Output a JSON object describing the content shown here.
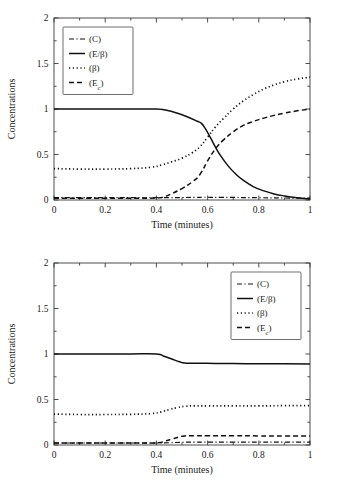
{
  "figure": {
    "background": "#ffffff",
    "ink_color": "#111111",
    "panels": [
      "top",
      "bottom"
    ]
  },
  "chart_data": [
    {
      "id": "top",
      "type": "line",
      "title": "",
      "xlabel": "Time (minutes)",
      "ylabel": "Concentrations",
      "xlim": [
        0,
        1
      ],
      "ylim": [
        0,
        2
      ],
      "xticks": [
        0,
        0.2,
        0.4,
        0.6,
        0.8,
        1
      ],
      "xticklabels": [
        "0",
        "0.2",
        "0.4",
        "0.6",
        "0.8",
        "1"
      ],
      "yticks": [
        0,
        0.5,
        1,
        1.5,
        2
      ],
      "yticklabels": [
        "0",
        "0.5",
        "1",
        "1.5",
        "2"
      ],
      "minor_ticks": true,
      "grid": false,
      "legend_position": "upper left",
      "series": [
        {
          "name": "(C)",
          "style": "dashdot",
          "x": [
            0,
            0.1,
            0.2,
            0.3,
            0.4,
            0.45,
            0.5,
            0.55,
            0.58,
            0.6,
            0.65,
            0.7,
            0.8,
            0.9,
            1
          ],
          "y": [
            0.025,
            0.025,
            0.025,
            0.025,
            0.025,
            0.026,
            0.027,
            0.029,
            0.03,
            0.03,
            0.029,
            0.028,
            0.025,
            0.022,
            0.02
          ]
        },
        {
          "name": "(E/β)",
          "style": "solid",
          "x": [
            0,
            0.1,
            0.2,
            0.3,
            0.4,
            0.44,
            0.48,
            0.52,
            0.56,
            0.575,
            0.59,
            0.61,
            0.63,
            0.65,
            0.68,
            0.71,
            0.74,
            0.78,
            0.82,
            0.86,
            0.9,
            0.95,
            1
          ],
          "y": [
            1.0,
            1.0,
            1.0,
            1.0,
            1.0,
            0.985,
            0.955,
            0.915,
            0.865,
            0.845,
            0.79,
            0.69,
            0.585,
            0.49,
            0.375,
            0.285,
            0.215,
            0.145,
            0.1,
            0.067,
            0.045,
            0.025,
            0.012
          ]
        },
        {
          "name": "(β)",
          "style": "dotted",
          "x": [
            0,
            0.1,
            0.2,
            0.3,
            0.38,
            0.42,
            0.46,
            0.5,
            0.54,
            0.57,
            0.6,
            0.63,
            0.66,
            0.7,
            0.74,
            0.78,
            0.82,
            0.86,
            0.9,
            0.95,
            1
          ],
          "y": [
            0.345,
            0.34,
            0.34,
            0.345,
            0.36,
            0.385,
            0.42,
            0.46,
            0.52,
            0.585,
            0.69,
            0.8,
            0.89,
            1.0,
            1.09,
            1.16,
            1.22,
            1.265,
            1.3,
            1.33,
            1.35
          ]
        },
        {
          "name": "(E_c)",
          "style": "dashed",
          "x": [
            0,
            0.1,
            0.2,
            0.3,
            0.4,
            0.43,
            0.46,
            0.5,
            0.54,
            0.57,
            0.6,
            0.63,
            0.66,
            0.7,
            0.74,
            0.78,
            0.82,
            0.86,
            0.9,
            0.95,
            1
          ],
          "y": [
            0.02,
            0.02,
            0.02,
            0.02,
            0.022,
            0.035,
            0.07,
            0.125,
            0.2,
            0.28,
            0.43,
            0.56,
            0.655,
            0.75,
            0.82,
            0.865,
            0.9,
            0.93,
            0.955,
            0.98,
            1.0
          ]
        }
      ]
    },
    {
      "id": "bottom",
      "type": "line",
      "title": "",
      "xlabel": "Time (minutes)",
      "ylabel": "Concentrations",
      "xlim": [
        0,
        1
      ],
      "ylim": [
        0,
        2
      ],
      "xticks": [
        0,
        0.2,
        0.4,
        0.6,
        0.8,
        1
      ],
      "xticklabels": [
        "0",
        "0.2",
        "0.4",
        "0.6",
        "0.8",
        "1"
      ],
      "yticks": [
        0,
        0.5,
        1,
        1.5,
        2
      ],
      "yticklabels": [
        "0",
        "0.5",
        "1",
        "1.5",
        "2"
      ],
      "minor_ticks": true,
      "grid": false,
      "legend_position": "upper right",
      "series": [
        {
          "name": "(C)",
          "style": "dashdot",
          "x": [
            0,
            0.1,
            0.2,
            0.3,
            0.4,
            0.45,
            0.5,
            0.55,
            0.6,
            0.7,
            0.8,
            0.9,
            1
          ],
          "y": [
            0.022,
            0.022,
            0.022,
            0.022,
            0.022,
            0.025,
            0.03,
            0.032,
            0.032,
            0.032,
            0.032,
            0.032,
            0.032
          ]
        },
        {
          "name": "(E/β)",
          "style": "solid",
          "x": [
            0,
            0.1,
            0.2,
            0.3,
            0.4,
            0.43,
            0.46,
            0.49,
            0.51,
            0.55,
            0.6,
            0.7,
            0.8,
            0.9,
            1
          ],
          "y": [
            1.0,
            1.0,
            1.0,
            1.0,
            1.0,
            0.975,
            0.945,
            0.915,
            0.9,
            0.898,
            0.897,
            0.895,
            0.893,
            0.892,
            0.89
          ]
        },
        {
          "name": "(β)",
          "style": "dotted",
          "x": [
            0,
            0.1,
            0.2,
            0.3,
            0.38,
            0.42,
            0.45,
            0.48,
            0.51,
            0.55,
            0.6,
            0.7,
            0.8,
            0.9,
            1
          ],
          "y": [
            0.34,
            0.335,
            0.335,
            0.337,
            0.345,
            0.365,
            0.39,
            0.41,
            0.425,
            0.43,
            0.43,
            0.43,
            0.43,
            0.432,
            0.432
          ]
        },
        {
          "name": "(E_c)",
          "style": "dashed",
          "x": [
            0,
            0.1,
            0.2,
            0.3,
            0.4,
            0.43,
            0.46,
            0.49,
            0.51,
            0.55,
            0.6,
            0.7,
            0.8,
            0.9,
            1
          ],
          "y": [
            0.022,
            0.022,
            0.022,
            0.022,
            0.024,
            0.04,
            0.065,
            0.09,
            0.1,
            0.102,
            0.102,
            0.102,
            0.1,
            0.1,
            0.1
          ]
        }
      ]
    }
  ]
}
